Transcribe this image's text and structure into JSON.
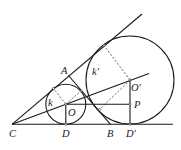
{
  "diagram": {
    "type": "geometry",
    "labels": {
      "C": "C",
      "A": "A",
      "B": "B",
      "D": "D",
      "D_prime": "D'",
      "O": "O",
      "O_prime": "O'",
      "P": "P",
      "k": "k",
      "k_prime": "k'"
    },
    "colors": {
      "stroke": "#1a1a1a",
      "background": "#ffffff"
    }
  }
}
